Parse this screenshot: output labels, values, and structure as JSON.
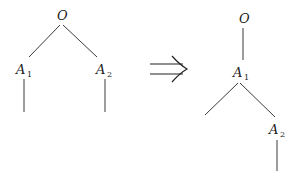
{
  "diagram": {
    "type": "tree-transformation",
    "arrow": "⟹",
    "left_tree": {
      "root": {
        "label": "O"
      },
      "children": [
        {
          "label": "A",
          "subscript": "1"
        },
        {
          "label": "A",
          "subscript": "2"
        }
      ]
    },
    "right_tree": {
      "root": {
        "label": "O"
      },
      "child": {
        "label": "A",
        "subscript": "1"
      },
      "grandchild": {
        "label": "A",
        "subscript": "2"
      }
    }
  }
}
